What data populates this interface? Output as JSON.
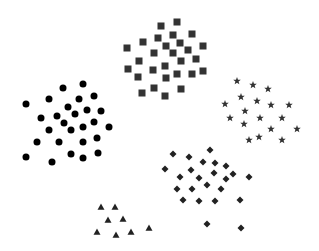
{
  "canvas": {
    "width": 319,
    "height": 251,
    "background": "#ffffff"
  },
  "clusters": [
    {
      "name": "squares",
      "shape": "square",
      "color": "#333333",
      "size": 7,
      "points": [
        [
          161,
          26
        ],
        [
          177,
          22
        ],
        [
          143,
          42
        ],
        [
          158,
          38
        ],
        [
          173,
          35
        ],
        [
          192,
          34
        ],
        [
          127,
          48
        ],
        [
          166,
          46
        ],
        [
          180,
          43
        ],
        [
          203,
          46
        ],
        [
          188,
          50
        ],
        [
          154,
          53
        ],
        [
          173,
          53
        ],
        [
          139,
          61
        ],
        [
          181,
          61
        ],
        [
          196,
          59
        ],
        [
          128,
          69
        ],
        [
          153,
          70
        ],
        [
          165,
          66
        ],
        [
          177,
          74
        ],
        [
          192,
          74
        ],
        [
          203,
          71
        ],
        [
          138,
          77
        ],
        [
          166,
          78
        ],
        [
          142,
          93
        ],
        [
          154,
          88
        ],
        [
          165,
          96
        ],
        [
          181,
          89
        ]
      ]
    },
    {
      "name": "circles",
      "shape": "circle",
      "color": "#000000",
      "size": 7,
      "points": [
        [
          83,
          84
        ],
        [
          63,
          88
        ],
        [
          94,
          96
        ],
        [
          49,
          99
        ],
        [
          79,
          99
        ],
        [
          26,
          104
        ],
        [
          68,
          107
        ],
        [
          87,
          110
        ],
        [
          101,
          111
        ],
        [
          57,
          116
        ],
        [
          75,
          114
        ],
        [
          41,
          118
        ],
        [
          64,
          123
        ],
        [
          94,
          122
        ],
        [
          83,
          127
        ],
        [
          109,
          127
        ],
        [
          49,
          130
        ],
        [
          71,
          130
        ],
        [
          97,
          138
        ],
        [
          37,
          142
        ],
        [
          59,
          142
        ],
        [
          83,
          142
        ],
        [
          71,
          154
        ],
        [
          98,
          153
        ],
        [
          26,
          157
        ],
        [
          83,
          158
        ],
        [
          52,
          162
        ]
      ]
    },
    {
      "name": "stars",
      "shape": "star",
      "color": "#333333",
      "size": 8,
      "points": [
        [
          237,
          81
        ],
        [
          253,
          85
        ],
        [
          268,
          89
        ],
        [
          241,
          97
        ],
        [
          225,
          104
        ],
        [
          257,
          101
        ],
        [
          271,
          105
        ],
        [
          289,
          105
        ],
        [
          245,
          111
        ],
        [
          230,
          118
        ],
        [
          260,
          118
        ],
        [
          282,
          118
        ],
        [
          244,
          124
        ],
        [
          271,
          129
        ],
        [
          297,
          129
        ],
        [
          259,
          137
        ],
        [
          249,
          140
        ],
        [
          282,
          140
        ]
      ]
    },
    {
      "name": "diamonds",
      "shape": "diamond",
      "color": "#222222",
      "size": 7,
      "points": [
        [
          210,
          150
        ],
        [
          173,
          154
        ],
        [
          189,
          157
        ],
        [
          203,
          162
        ],
        [
          215,
          163
        ],
        [
          226,
          166
        ],
        [
          165,
          169
        ],
        [
          191,
          170
        ],
        [
          214,
          173
        ],
        [
          233,
          174
        ],
        [
          180,
          177
        ],
        [
          199,
          178
        ],
        [
          226,
          179
        ],
        [
          249,
          177
        ],
        [
          207,
          185
        ],
        [
          177,
          189
        ],
        [
          192,
          189
        ],
        [
          221,
          189
        ],
        [
          183,
          200
        ],
        [
          199,
          201
        ],
        [
          215,
          201
        ],
        [
          240,
          200
        ],
        [
          207,
          224
        ],
        [
          241,
          228
        ]
      ]
    },
    {
      "name": "triangles",
      "shape": "triangle",
      "color": "#222222",
      "size": 7,
      "points": [
        [
          101,
          207
        ],
        [
          115,
          207
        ],
        [
          108,
          220
        ],
        [
          123,
          219
        ],
        [
          97,
          232
        ],
        [
          116,
          235
        ],
        [
          131,
          232
        ],
        [
          149,
          228
        ]
      ]
    }
  ]
}
